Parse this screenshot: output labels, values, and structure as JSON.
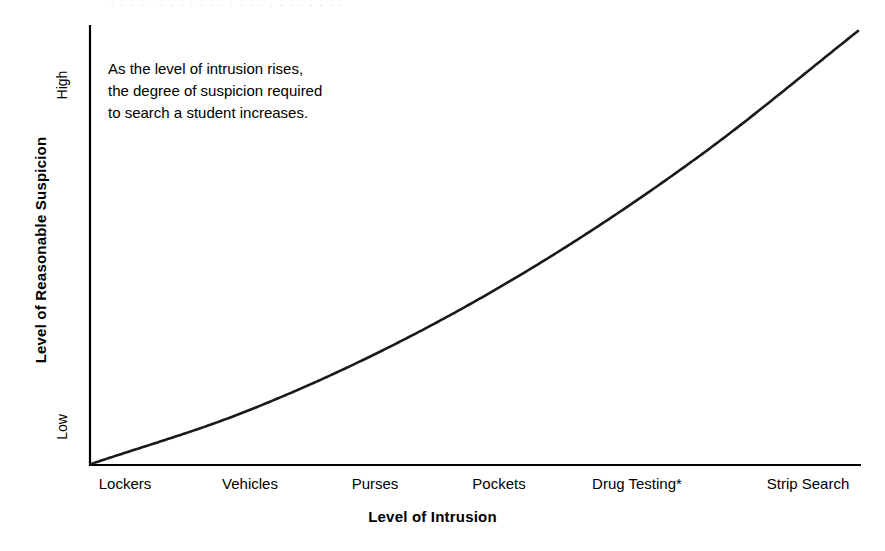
{
  "figure": {
    "background_color": "#ffffff",
    "ink_color": "#000000",
    "bleed_text": "· · · · · · · · · · · · · · · · · · · · · · · ·"
  },
  "annotation": {
    "text": "As the level of intrusion rises,\nthe degree of suspicion required\nto search a student increases."
  },
  "chart_data": {
    "type": "line",
    "title": "",
    "subtitle": "",
    "xlabel": "Level of Intrusion",
    "ylabel": "Level of Reasonable Suspicion",
    "categories": [
      "Lockers",
      "Vehicles",
      "Purses",
      "Pockets",
      "Drug Testing*",
      "Strip Search"
    ],
    "x": [
      0,
      1,
      2,
      3,
      4,
      5
    ],
    "values": [
      0,
      12,
      28,
      48,
      72,
      100
    ],
    "series": [
      {
        "name": "Reasonable suspicion required",
        "values": [
          0,
          12,
          28,
          48,
          72,
          100
        ]
      }
    ],
    "ytick_labels": [
      "Low",
      "High"
    ],
    "ytick_values": [
      2,
      92
    ],
    "ylim": [
      0,
      100
    ],
    "xlim": [
      0,
      5
    ],
    "grid": false,
    "legend": false,
    "legend_position": "none",
    "curve_shape": "monotonic increasing, convex (accelerating)",
    "annotations": [
      "As the level of intrusion rises, the degree of suspicion required to search a student increases."
    ],
    "footnote_marker": "*"
  }
}
